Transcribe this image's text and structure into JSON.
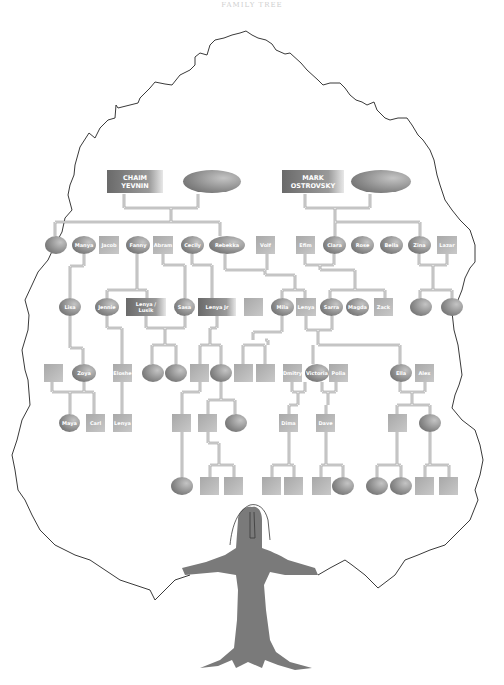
{
  "title": "FAMILY TREE",
  "colors": {
    "line": "#8a8a8a",
    "trunk": "#7a7a7a",
    "outline": "#3a3a3a",
    "node_dark": "#666666",
    "node_light": "#e0e0e0",
    "text": "#ffffff"
  },
  "generations": [
    {
      "level": 1,
      "nodes": [
        {
          "id": "chaim",
          "shape": "rect",
          "label": "CHAIM YEVNIN",
          "x": 107,
          "y": 170,
          "w": 56,
          "h": 23
        },
        {
          "id": "chaim-spouse",
          "shape": "ellipse",
          "label": "",
          "x": 183,
          "y": 170,
          "w": 58,
          "h": 23
        },
        {
          "id": "mark",
          "shape": "rect",
          "label": "MARK OSTROVSKY",
          "x": 282,
          "y": 170,
          "w": 62,
          "h": 23
        },
        {
          "id": "mark-spouse",
          "shape": "ellipse",
          "label": "",
          "x": 351,
          "y": 170,
          "w": 60,
          "h": 23
        }
      ]
    },
    {
      "level": 2,
      "nodes": [
        {
          "id": "g2-1",
          "shape": "ellipse",
          "label": "",
          "x": 45,
          "y": 236,
          "w": 22,
          "h": 18
        },
        {
          "id": "manya",
          "shape": "ellipse",
          "label": "Manya",
          "x": 72,
          "y": 236,
          "w": 24,
          "h": 18
        },
        {
          "id": "jacob",
          "shape": "rect",
          "label": "Jacob",
          "x": 99,
          "y": 236,
          "w": 20,
          "h": 18
        },
        {
          "id": "fanny",
          "shape": "ellipse",
          "label": "Fanny",
          "x": 126,
          "y": 236,
          "w": 24,
          "h": 18
        },
        {
          "id": "abram",
          "shape": "rect",
          "label": "Abram",
          "x": 153,
          "y": 236,
          "w": 20,
          "h": 18
        },
        {
          "id": "cecily",
          "shape": "ellipse",
          "label": "Cecily",
          "x": 181,
          "y": 236,
          "w": 23,
          "h": 18
        },
        {
          "id": "rebekka",
          "shape": "ellipse",
          "label": "Rebekka",
          "x": 209,
          "y": 236,
          "w": 36,
          "h": 18
        },
        {
          "id": "volf",
          "shape": "rect",
          "label": "Volf",
          "x": 256,
          "y": 236,
          "w": 19,
          "h": 18
        },
        {
          "id": "efim",
          "shape": "rect",
          "label": "Efim",
          "x": 296,
          "y": 236,
          "w": 19,
          "h": 18
        },
        {
          "id": "clara",
          "shape": "ellipse",
          "label": "Clara",
          "x": 323,
          "y": 236,
          "w": 23,
          "h": 18
        },
        {
          "id": "rose",
          "shape": "ellipse",
          "label": "Rose",
          "x": 351,
          "y": 236,
          "w": 23,
          "h": 18
        },
        {
          "id": "bella",
          "shape": "ellipse",
          "label": "Bella",
          "x": 380,
          "y": 236,
          "w": 23,
          "h": 18
        },
        {
          "id": "zina",
          "shape": "ellipse",
          "label": "Zina",
          "x": 408,
          "y": 236,
          "w": 23,
          "h": 18
        },
        {
          "id": "lazar",
          "shape": "rect",
          "label": "Lazar",
          "x": 437,
          "y": 236,
          "w": 20,
          "h": 18
        }
      ]
    },
    {
      "level": 3,
      "nodes": [
        {
          "id": "lisa",
          "shape": "ellipse",
          "label": "Lisa",
          "x": 59,
          "y": 298,
          "w": 22,
          "h": 18
        },
        {
          "id": "jennie",
          "shape": "ellipse",
          "label": "Jennie",
          "x": 95,
          "y": 298,
          "w": 24,
          "h": 18
        },
        {
          "id": "lenya-lusik",
          "shape": "rect",
          "label": "Lenya / Lusik",
          "x": 126,
          "y": 298,
          "w": 40,
          "h": 18
        },
        {
          "id": "sasa",
          "shape": "ellipse",
          "label": "Sasa",
          "x": 174,
          "y": 298,
          "w": 21,
          "h": 18
        },
        {
          "id": "lenya-jr",
          "shape": "rect",
          "label": "Lenya Jr",
          "x": 198,
          "y": 298,
          "w": 38,
          "h": 18
        },
        {
          "id": "g3-blank-1",
          "shape": "rect",
          "label": "",
          "x": 244,
          "y": 298,
          "w": 19,
          "h": 18
        },
        {
          "id": "mila",
          "shape": "ellipse",
          "label": "Mila",
          "x": 271,
          "y": 298,
          "w": 23,
          "h": 18
        },
        {
          "id": "lenya",
          "shape": "rect",
          "label": "Lenya",
          "x": 296,
          "y": 298,
          "w": 20,
          "h": 18
        },
        {
          "id": "sarra",
          "shape": "ellipse",
          "label": "Sarra",
          "x": 320,
          "y": 298,
          "w": 23,
          "h": 18
        },
        {
          "id": "magda",
          "shape": "ellipse",
          "label": "Magda",
          "x": 346,
          "y": 298,
          "w": 23,
          "h": 18
        },
        {
          "id": "zack",
          "shape": "rect",
          "label": "Zack",
          "x": 374,
          "y": 298,
          "w": 19,
          "h": 18
        },
        {
          "id": "g3-e1",
          "shape": "ellipse",
          "label": "",
          "x": 410,
          "y": 298,
          "w": 22,
          "h": 18
        },
        {
          "id": "g3-e2",
          "shape": "ellipse",
          "label": "",
          "x": 441,
          "y": 298,
          "w": 22,
          "h": 18
        }
      ]
    },
    {
      "level": 4,
      "nodes": [
        {
          "id": "g4-r1",
          "shape": "rect",
          "label": "",
          "x": 44,
          "y": 364,
          "w": 19,
          "h": 18
        },
        {
          "id": "zoya",
          "shape": "ellipse",
          "label": "Zoya",
          "x": 72,
          "y": 364,
          "w": 24,
          "h": 18
        },
        {
          "id": "eloshe",
          "shape": "rect",
          "label": "Eloshe",
          "x": 113,
          "y": 364,
          "w": 19,
          "h": 18
        },
        {
          "id": "g4-e1",
          "shape": "ellipse",
          "label": "",
          "x": 142,
          "y": 364,
          "w": 22,
          "h": 18
        },
        {
          "id": "g4-e2",
          "shape": "ellipse",
          "label": "",
          "x": 165,
          "y": 364,
          "w": 22,
          "h": 18
        },
        {
          "id": "g4-r2",
          "shape": "rect",
          "label": "",
          "x": 190,
          "y": 364,
          "w": 19,
          "h": 18
        },
        {
          "id": "g4-e3",
          "shape": "ellipse",
          "label": "",
          "x": 210,
          "y": 364,
          "w": 22,
          "h": 18
        },
        {
          "id": "g4-r3",
          "shape": "rect",
          "label": "",
          "x": 234,
          "y": 364,
          "w": 19,
          "h": 18
        },
        {
          "id": "g4-r4",
          "shape": "rect",
          "label": "",
          "x": 256,
          "y": 364,
          "w": 19,
          "h": 18
        },
        {
          "id": "dmitry",
          "shape": "rect",
          "label": "Dmitry",
          "x": 283,
          "y": 364,
          "w": 19,
          "h": 18
        },
        {
          "id": "victoria",
          "shape": "ellipse",
          "label": "Victoria",
          "x": 305,
          "y": 364,
          "w": 24,
          "h": 18
        },
        {
          "id": "polia",
          "shape": "rect",
          "label": "Polia",
          "x": 329,
          "y": 364,
          "w": 19,
          "h": 18
        },
        {
          "id": "ella",
          "shape": "ellipse",
          "label": "Ella",
          "x": 390,
          "y": 364,
          "w": 22,
          "h": 18
        },
        {
          "id": "alex",
          "shape": "rect",
          "label": "Alex",
          "x": 415,
          "y": 364,
          "w": 19,
          "h": 18
        }
      ]
    },
    {
      "level": 5,
      "nodes": [
        {
          "id": "maya",
          "shape": "ellipse",
          "label": "Maya",
          "x": 59,
          "y": 414,
          "w": 21,
          "h": 18
        },
        {
          "id": "carl",
          "shape": "rect",
          "label": "Carl",
          "x": 86,
          "y": 414,
          "w": 19,
          "h": 18
        },
        {
          "id": "lenya-2",
          "shape": "rect",
          "label": "Lenya",
          "x": 113,
          "y": 414,
          "w": 19,
          "h": 18
        },
        {
          "id": "g5-r1",
          "shape": "rect",
          "label": "",
          "x": 172,
          "y": 414,
          "w": 19,
          "h": 18
        },
        {
          "id": "g5-r2",
          "shape": "rect",
          "label": "",
          "x": 198,
          "y": 414,
          "w": 19,
          "h": 18
        },
        {
          "id": "g5-e1",
          "shape": "ellipse",
          "label": "",
          "x": 225,
          "y": 414,
          "w": 22,
          "h": 18
        },
        {
          "id": "dima",
          "shape": "rect",
          "label": "Dima",
          "x": 279,
          "y": 414,
          "w": 19,
          "h": 18
        },
        {
          "id": "dave",
          "shape": "rect",
          "label": "Dave",
          "x": 316,
          "y": 414,
          "w": 19,
          "h": 18
        },
        {
          "id": "g5-r3",
          "shape": "rect",
          "label": "",
          "x": 388,
          "y": 414,
          "w": 19,
          "h": 18
        },
        {
          "id": "g5-e2",
          "shape": "ellipse",
          "label": "",
          "x": 419,
          "y": 414,
          "w": 22,
          "h": 18
        }
      ]
    },
    {
      "level": 6,
      "nodes": [
        {
          "id": "g6-e1",
          "shape": "ellipse",
          "label": "",
          "x": 171,
          "y": 477,
          "w": 22,
          "h": 18
        },
        {
          "id": "g6-r1",
          "shape": "rect",
          "label": "",
          "x": 200,
          "y": 477,
          "w": 19,
          "h": 18
        },
        {
          "id": "g6-r2",
          "shape": "rect",
          "label": "",
          "x": 224,
          "y": 477,
          "w": 19,
          "h": 18
        },
        {
          "id": "g6-r3",
          "shape": "rect",
          "label": "",
          "x": 262,
          "y": 477,
          "w": 19,
          "h": 18
        },
        {
          "id": "g6-r4",
          "shape": "rect",
          "label": "",
          "x": 284,
          "y": 477,
          "w": 19,
          "h": 18
        },
        {
          "id": "g6-r5",
          "shape": "rect",
          "label": "",
          "x": 312,
          "y": 477,
          "w": 19,
          "h": 18
        },
        {
          "id": "g6-e2",
          "shape": "ellipse",
          "label": "",
          "x": 332,
          "y": 477,
          "w": 22,
          "h": 18
        },
        {
          "id": "g6-e3",
          "shape": "ellipse",
          "label": "",
          "x": 366,
          "y": 477,
          "w": 22,
          "h": 18
        },
        {
          "id": "g6-e4",
          "shape": "ellipse",
          "label": "",
          "x": 390,
          "y": 477,
          "w": 22,
          "h": 18
        },
        {
          "id": "g6-r6",
          "shape": "rect",
          "label": "",
          "x": 415,
          "y": 477,
          "w": 19,
          "h": 18
        },
        {
          "id": "g6-r7",
          "shape": "rect",
          "label": "",
          "x": 439,
          "y": 477,
          "w": 19,
          "h": 18
        }
      ]
    }
  ],
  "connectors": [
    "M124,194 V208 M198,194 V208 M124,208 H198 M171,208 V222 M55,222 H220 M55,222 V236 M220,222 V236",
    "M305,194 V208 M370,194 V208 M305,208 H370 M335,208 V222 M335,222 H420 M335,222 V236 M420,222 V236",
    "M84,254 V266 M84,266 H70 M70,266 V298",
    "M137,254 V290 M107,290 H147 M107,290 V298 M147,290 V298",
    "M163,254 V265 M163,265 H185 M185,265 V298",
    "M192,254 V265 M192,265 H212 M212,265 V298",
    "M225,254 V270 M225,270 H265 M265,270 V275 M265,275 H295 M295,275 V290 M282,290 H305 M282,290 V298 M305,290 V298 M267,254 V270",
    "M305,254 V265 M334,254 V265 M305,265 H334 M320,265 V270 M320,270 H355 M355,270 V290 M330,290 H385 M330,290 V298 M385,290 V298",
    "M419,254 V265 M447,254 V265 M419,265 H447 M433,265 V290 M420,290 H452 M420,290 V298 M452,290 V298",
    "M70,316 V348 M70,348 H83 M83,348 V364",
    "M107,316 V328 M107,328 H122 M122,328 V364",
    "M146,316 V328 M185,316 V328 M146,328 H185 M165,328 V345 M152,345 H176 M152,345 V364 M176,345 V364",
    "M217,316 V328 M217,328 H210 M210,328 V345 M200,345 H221 M200,345 V364 M221,345 V364",
    "M282,316 V332 M253,332 H282 M253,332 V340 M265,340 H268 M268,340 V345 M243,345 H265 M243,345 V364 M265,345 V364",
    "M306,316 V330 M332,316 V330 M306,330 H332 M318,330 V345 M318,345 H400 M313,345 V364 M400,345 V364",
    "M52,382 V392 M52,392 H94 M94,392 V414 M84,382 V392 M70,392 V414",
    "M122,382 V414",
    "M200,382 V392 M200,392 H182 M182,392 V414",
    "M221,382 V400 M208,400 H235 M208,400 V414 M235,400 V414",
    "M292,382 V392 M305,382 V392 M292,392 H305 M298,392 V405 M289,405 H298 M289,405 V414",
    "M322,382 V392 M336,382 V392 M322,392 H336 M328,392 V405 M326,405 V414",
    "M400,382 V392 M425,382 V392 M400,392 H425 M412,392 V405 M397,405 H430 M397,405 V414 M430,405 V414",
    "M182,432 V477",
    "M208,432 V443 M208,443 H219 M219,443 V465 M210,465 H234 M210,465 V477 M234,465 V477",
    "M289,432 V465 M272,465 H294 M272,465 V477 M294,465 V477",
    "M326,432 V465 M321,465 H343 M321,465 V477 M343,465 V477",
    "M397,432 V465 M377,465 H401 M377,465 V477 M401,465 V477",
    "M430,432 V465 M425,465 H449 M425,465 V477 M449,465 V477"
  ]
}
